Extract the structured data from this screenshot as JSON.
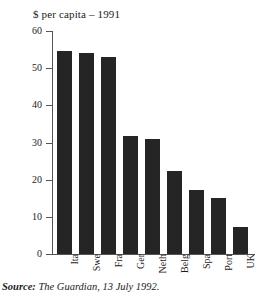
{
  "chart_data": {
    "type": "bar",
    "title": "$ per capita – 1991",
    "xlabel": "",
    "ylabel": "",
    "ylim": [
      0,
      60
    ],
    "yticks": [
      0,
      10,
      20,
      30,
      40,
      50,
      60
    ],
    "grid": false,
    "legend": "none",
    "categories": [
      "Ita",
      "Swe",
      "Fra",
      "Ger",
      "Neth",
      "Belg",
      "Spa",
      "Port",
      "UK"
    ],
    "values": [
      54.7,
      54.0,
      53.0,
      31.8,
      31.0,
      22.3,
      17.2,
      15.1,
      7.3
    ],
    "bar_color": "#252525",
    "axis_color": "#555555",
    "background": "#ffffff"
  },
  "source": {
    "label": "Source:",
    "text": "The Guardian, 13 July 1992."
  }
}
